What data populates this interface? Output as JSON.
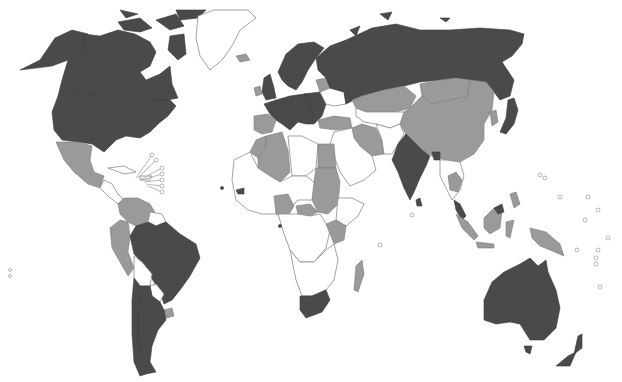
{
  "map": {
    "type": "choropleth-world",
    "categories": [
      {
        "id": "dark",
        "color": "#4a4a4a"
      },
      {
        "id": "mid",
        "color": "#9a9a9a"
      },
      {
        "id": "none",
        "color": "#ffffff"
      }
    ],
    "regions": [
      {
        "name": "Canada",
        "category": "dark"
      },
      {
        "name": "United States",
        "category": "dark"
      },
      {
        "name": "Alaska",
        "category": "dark"
      },
      {
        "name": "Greenland",
        "category": "none"
      },
      {
        "name": "Iceland",
        "category": "mid"
      },
      {
        "name": "Mexico",
        "category": "mid"
      },
      {
        "name": "Cuba",
        "category": "none"
      },
      {
        "name": "Central America",
        "category": "none"
      },
      {
        "name": "Colombia",
        "category": "mid"
      },
      {
        "name": "Venezuela",
        "category": "mid"
      },
      {
        "name": "Guianas",
        "category": "none"
      },
      {
        "name": "Ecuador",
        "category": "mid"
      },
      {
        "name": "Peru",
        "category": "mid"
      },
      {
        "name": "Brazil",
        "category": "dark"
      },
      {
        "name": "Bolivia",
        "category": "none"
      },
      {
        "name": "Paraguay",
        "category": "none"
      },
      {
        "name": "Uruguay",
        "category": "mid"
      },
      {
        "name": "Chile",
        "category": "dark"
      },
      {
        "name": "Argentina",
        "category": "dark"
      },
      {
        "name": "Western Europe",
        "category": "dark"
      },
      {
        "name": "Scandinavia",
        "category": "dark"
      },
      {
        "name": "United Kingdom",
        "category": "dark"
      },
      {
        "name": "Ireland",
        "category": "mid"
      },
      {
        "name": "Iberia",
        "category": "mid"
      },
      {
        "name": "Eastern Europe",
        "category": "dark"
      },
      {
        "name": "Belarus",
        "category": "mid"
      },
      {
        "name": "Ukraine",
        "category": "none"
      },
      {
        "name": "Russia",
        "category": "dark"
      },
      {
        "name": "Turkey",
        "category": "mid"
      },
      {
        "name": "Kazakhstan",
        "category": "mid"
      },
      {
        "name": "Mongolia",
        "category": "mid"
      },
      {
        "name": "China",
        "category": "mid"
      },
      {
        "name": "Iran",
        "category": "mid"
      },
      {
        "name": "Middle East",
        "category": "none"
      },
      {
        "name": "Central Asia",
        "category": "none"
      },
      {
        "name": "India",
        "category": "dark"
      },
      {
        "name": "Bangladesh",
        "category": "dark"
      },
      {
        "name": "Sri Lanka",
        "category": "dark"
      },
      {
        "name": "Southeast Asia Mainland",
        "category": "none"
      },
      {
        "name": "Thailand",
        "category": "mid"
      },
      {
        "name": "Japan",
        "category": "dark"
      },
      {
        "name": "Korea",
        "category": "mid"
      },
      {
        "name": "Malaysia",
        "category": "dark"
      },
      {
        "name": "Indonesia",
        "category": "mid"
      },
      {
        "name": "Borneo",
        "category": "mid"
      },
      {
        "name": "Philippines",
        "category": "mid"
      },
      {
        "name": "Papua New Guinea",
        "category": "mid"
      },
      {
        "name": "Australia",
        "category": "dark"
      },
      {
        "name": "New Zealand",
        "category": "dark"
      },
      {
        "name": "Algeria",
        "category": "mid"
      },
      {
        "name": "Morocco",
        "category": "mid"
      },
      {
        "name": "Libya",
        "category": "none"
      },
      {
        "name": "Egypt",
        "category": "mid"
      },
      {
        "name": "Sudan",
        "category": "mid"
      },
      {
        "name": "West Africa",
        "category": "none"
      },
      {
        "name": "Nigeria",
        "category": "mid"
      },
      {
        "name": "Central African Republic",
        "category": "mid"
      },
      {
        "name": "Ethiopia",
        "category": "none"
      },
      {
        "name": "Kenya",
        "category": "mid"
      },
      {
        "name": "Uganda",
        "category": "mid"
      },
      {
        "name": "Central Africa",
        "category": "none"
      },
      {
        "name": "Zambia",
        "category": "none"
      },
      {
        "name": "Malawi",
        "category": "mid"
      },
      {
        "name": "Zimbabwe",
        "category": "mid"
      },
      {
        "name": "Southern Africa",
        "category": "none"
      },
      {
        "name": "South Africa",
        "category": "dark"
      },
      {
        "name": "Madagascar",
        "category": "mid"
      }
    ]
  }
}
